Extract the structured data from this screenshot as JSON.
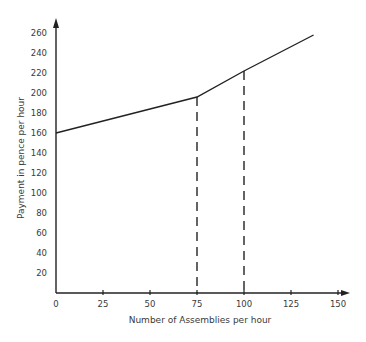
{
  "chart_data": {
    "type": "line",
    "title": "",
    "xlabel": "Number of Assemblies per hour",
    "ylabel": "Payment in pence per hour",
    "xlim": [
      0,
      150
    ],
    "ylim": [
      0,
      270
    ],
    "x_ticks": [
      "0",
      "25",
      "50",
      "75",
      "100",
      "125",
      "150"
    ],
    "y_ticks": [
      "20",
      "40",
      "60",
      "80",
      "100",
      "120",
      "140",
      "160",
      "180",
      "200",
      "220",
      "240",
      "260"
    ],
    "grid": false,
    "legend": null,
    "series": [
      {
        "name": "Payment",
        "x": [
          0,
          75,
          100,
          137
        ],
        "y": [
          160,
          196,
          222,
          258
        ]
      }
    ],
    "annotations": [
      {
        "type": "dashed-vertical",
        "x": 75,
        "y_top": 196
      },
      {
        "type": "dashed-vertical",
        "x": 100,
        "y_top": 222
      }
    ]
  }
}
